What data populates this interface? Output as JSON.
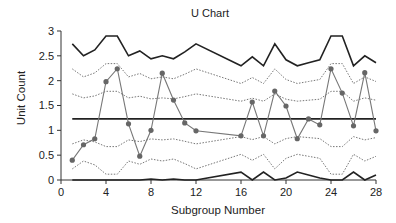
{
  "chart_data": {
    "type": "line",
    "title": "U Chart",
    "xlabel": "Subgroup Number",
    "ylabel": "Unit Count",
    "xlim": [
      0,
      28
    ],
    "ylim": [
      0,
      3
    ],
    "x_ticks": [
      0,
      4,
      8,
      12,
      16,
      20,
      24,
      28
    ],
    "y_ticks": [
      0,
      0.5,
      1,
      1.5,
      2,
      2.5,
      3
    ],
    "y_tick_labels": [
      "0",
      "0.5",
      "1",
      "1.5",
      "2",
      "2.5",
      "3"
    ],
    "grid": false,
    "legend": null,
    "center_line": 1.23,
    "series": [
      {
        "name": "Unit Count (u)",
        "style": "gray line with dot markers",
        "x": [
          1,
          2,
          3,
          4,
          5,
          6,
          7,
          8,
          9,
          10,
          11,
          12,
          16,
          17,
          18,
          19,
          20,
          21,
          22,
          23,
          24,
          25,
          26,
          27,
          28
        ],
        "values": [
          0.4,
          0.71,
          0.83,
          1.98,
          2.24,
          1.13,
          0.48,
          1.0,
          2.15,
          1.61,
          1.15,
          0.99,
          0.89,
          1.57,
          0.89,
          1.79,
          1.49,
          0.83,
          1.23,
          1.11,
          2.24,
          1.75,
          1.09,
          2.16,
          0.99
        ]
      },
      {
        "name": "UCL (3 sigma)",
        "style": "solid dark",
        "x": [
          1,
          2,
          3,
          4,
          5,
          6,
          7,
          8,
          9,
          10,
          11,
          12,
          16,
          17,
          18,
          19,
          20,
          21,
          22,
          23,
          24,
          25,
          26,
          27,
          28
        ],
        "values": [
          2.74,
          2.5,
          2.62,
          2.9,
          2.9,
          2.5,
          2.6,
          2.44,
          2.5,
          2.44,
          2.58,
          2.74,
          2.3,
          2.48,
          2.3,
          2.74,
          2.42,
          2.3,
          2.36,
          2.42,
          2.9,
          2.9,
          2.3,
          2.5,
          2.36
        ]
      }
    ]
  },
  "labels": {
    "title": "U Chart",
    "xlabel": "Subgroup Number",
    "ylabel": "Unit Count"
  }
}
